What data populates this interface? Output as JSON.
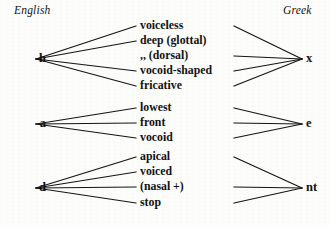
{
  "headers": {
    "left": "English",
    "right": "Greek"
  },
  "groups": [
    {
      "id": "h-x",
      "source": "h",
      "target": "x",
      "source_y": 59,
      "target_y": 59,
      "features": [
        {
          "label": "voiceless",
          "y": 26,
          "left_link": true,
          "right_link": true
        },
        {
          "label": "deep (glottal)",
          "y": 41,
          "left_link": true,
          "right_link": false
        },
        {
          "label": ",,   (dorsal)",
          "y": 56,
          "left_link": false,
          "right_link": true
        },
        {
          "label": "vocoid-shaped",
          "y": 71,
          "left_link": true,
          "right_link": true
        },
        {
          "label": "fricative",
          "y": 86,
          "left_link": true,
          "right_link": true
        }
      ]
    },
    {
      "id": "a-e",
      "source": "a",
      "target": "e",
      "source_y": 124,
      "target_y": 124,
      "features": [
        {
          "label": "lowest",
          "y": 108,
          "left_link": true,
          "right_link": true
        },
        {
          "label": "front",
          "y": 123,
          "left_link": true,
          "right_link": true
        },
        {
          "label": "vocoid",
          "y": 138,
          "left_link": true,
          "right_link": true
        }
      ]
    },
    {
      "id": "d-nt",
      "source": "d",
      "target": "nt",
      "source_y": 188,
      "target_y": 188,
      "features": [
        {
          "label": "apical",
          "y": 157,
          "left_link": true,
          "right_link": true
        },
        {
          "label": "voiced",
          "y": 172,
          "left_link": true,
          "right_link": false
        },
        {
          "label": "(nasal +)",
          "y": 187,
          "left_link": true,
          "right_link": true
        },
        {
          "label": "stop",
          "y": 203,
          "left_link": true,
          "right_link": true
        }
      ]
    }
  ],
  "geometry": {
    "left_anchor_x": 36,
    "left_fan_x": 136,
    "right_fan_x": 234,
    "right_anchor_x": 302,
    "feature_text_x": 140
  },
  "colors": {
    "ink": "#151515",
    "paper": "#fdfdfc"
  }
}
